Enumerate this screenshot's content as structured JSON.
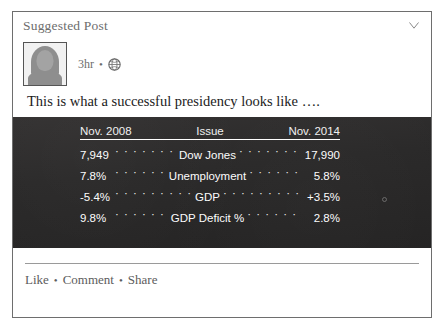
{
  "post": {
    "suggested_label": "Suggested Post",
    "collapse_icon": "chevron-down-icon",
    "author": {
      "avatar_icon": "default-user-avatar",
      "timestamp": "3hr",
      "separator": "•",
      "privacy_icon": "globe-icon"
    },
    "text": "This is what a successful presidency looks like ….",
    "footer": {
      "like": "Like",
      "comment": "Comment",
      "share": "Share",
      "separator": "•"
    }
  },
  "image": {
    "background_color": "#2b2b2b",
    "text_color": "#ffffff",
    "table": {
      "headers": {
        "left": "Nov. 2008",
        "middle": "Issue",
        "right": "Nov. 2014"
      },
      "rows": [
        {
          "left": "7,949",
          "label": "Dow Jones",
          "right": "17,990"
        },
        {
          "left": "7.8%",
          "label": "Unemployment",
          "right": "5.8%"
        },
        {
          "left": "-5.4%",
          "label": "GDP",
          "right": "+3.5%"
        },
        {
          "left": "9.8%",
          "label": "GDP Deficit %",
          "right": "2.8%"
        }
      ]
    }
  }
}
